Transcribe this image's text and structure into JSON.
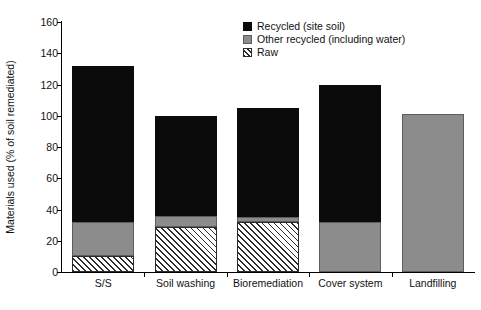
{
  "chart_data": {
    "type": "bar",
    "title": "",
    "xlabel": "",
    "ylabel": "Materials used (% of soil remediated)",
    "ylim": [
      0,
      160
    ],
    "yticks": [
      0,
      20,
      40,
      60,
      80,
      100,
      120,
      140,
      160
    ],
    "grid": false,
    "stacked": true,
    "stack_order_bottom_to_top": [
      "Raw",
      "Other recycled (including water)",
      "Recycled (site soil)"
    ],
    "legend_position": "top-right",
    "categories": [
      "S/S",
      "Soil washing",
      "Bioremediation",
      "Cover system",
      "Landfilling"
    ],
    "series": [
      {
        "name": "Recycled (site soil)",
        "color": "#0b0b0b",
        "fill": "solid-black",
        "values": [
          100,
          64,
          70,
          88,
          0
        ]
      },
      {
        "name": "Other recycled (including water)",
        "color": "#8c8c8c",
        "fill": "solid-gray",
        "values": [
          22,
          7,
          3,
          32,
          101
        ]
      },
      {
        "name": "Raw",
        "color": "#2b2b2b",
        "fill": "diagonal-hatch",
        "values": [
          10,
          29,
          32,
          0,
          0
        ]
      }
    ],
    "totals": [
      132,
      100,
      105,
      120,
      101
    ]
  },
  "legend": {
    "items": [
      {
        "label": "Recycled (site soil)",
        "swatch": "black"
      },
      {
        "label": "Other recycled (including water)",
        "swatch": "gray"
      },
      {
        "label": "Raw",
        "swatch": "hatch"
      }
    ]
  },
  "axes": {
    "y_title": "Materials used (% of soil remediated)",
    "y_tick_labels": [
      "0",
      "20",
      "40",
      "60",
      "80",
      "100",
      "120",
      "140",
      "160"
    ],
    "x_tick_labels": [
      "S/S",
      "Soil washing",
      "Bioremediation",
      "Cover system",
      "Landfilling"
    ]
  },
  "caption": {
    "text": ""
  }
}
